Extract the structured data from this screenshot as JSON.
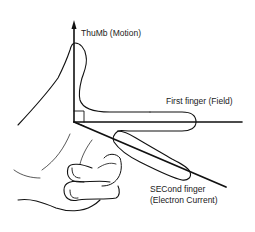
{
  "diagram": {
    "labels": {
      "thumb": "ThuMb (Motion)",
      "first_finger": "First finger (Field)",
      "second_finger_line1": "SECond finger",
      "second_finger_line2": "(Electron Current)"
    },
    "axes": [
      {
        "name": "thumb",
        "meaning": "Motion",
        "direction": "up"
      },
      {
        "name": "first finger",
        "meaning": "Field",
        "direction": "right"
      },
      {
        "name": "second finger",
        "meaning": "Electron Current",
        "direction": "down-right"
      }
    ],
    "colors": {
      "stroke": "#111111",
      "background": "#ffffff"
    }
  }
}
